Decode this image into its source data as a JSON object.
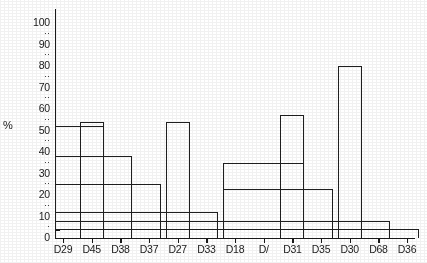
{
  "axis": {
    "y_unit_label": "%",
    "y_major_ticks": [
      "100",
      "90",
      "80",
      "70",
      "60",
      "50",
      "40",
      "30",
      "20",
      "10",
      "0"
    ],
    "y_minor_glyph": "··",
    "y_minor_glyph_low": "·",
    "y_min": 0,
    "y_max": 100
  },
  "chart_data": {
    "type": "bar",
    "title": "",
    "xlabel": "",
    "ylabel": "%",
    "ylim": [
      0,
      100
    ],
    "grid": false,
    "legend": "none",
    "note": "Nested step-outline histogram: adjacent categories share horizontal top edges, drawn as a single continuous outline rather than separate bars.",
    "categories": [
      "D29",
      "D45",
      "D38",
      "D37",
      "D27",
      "D33",
      "D18",
      "D/",
      "D31",
      "D35",
      "D30",
      "D68",
      "D36"
    ],
    "values": [
      52,
      54,
      38,
      25,
      54,
      12,
      12,
      35,
      57,
      23,
      80,
      8,
      4
    ],
    "series": [
      {
        "name": "percent",
        "values": [
          52,
          54,
          38,
          25,
          54,
          12,
          12,
          35,
          57,
          23,
          80,
          8,
          4
        ]
      }
    ],
    "levels": [
      {
        "category_span": [
          "D29",
          "D45"
        ],
        "value": 52
      },
      {
        "category_span": [
          "D45"
        ],
        "value": 54
      },
      {
        "category_span": [
          "D29",
          "D38"
        ],
        "value": 38
      },
      {
        "category_span": [
          "D29",
          "D37"
        ],
        "value": 25
      },
      {
        "category_span": [
          "D27"
        ],
        "value": 54
      },
      {
        "category_span": [
          "D29",
          "D33"
        ],
        "value": 12
      },
      {
        "category_span": [
          "D31"
        ],
        "value": 57
      },
      {
        "category_span": [
          "D18",
          "D31"
        ],
        "value": 35
      },
      {
        "category_span": [
          "D18",
          "D35"
        ],
        "value": 23
      },
      {
        "category_span": [
          "D30"
        ],
        "value": 80
      },
      {
        "category_span": [
          "D29",
          "D68"
        ],
        "value": 8
      },
      {
        "category_span": [
          "D29",
          "D36"
        ],
        "value": 4
      }
    ]
  }
}
